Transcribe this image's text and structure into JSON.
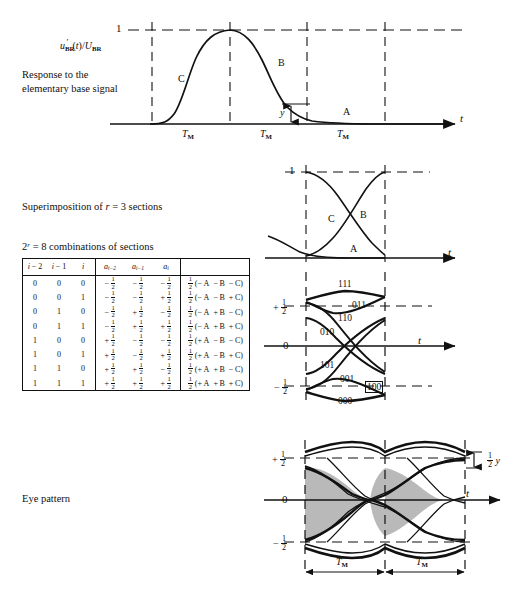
{
  "figure": {
    "panels": [
      {
        "id": "response",
        "caption_lines": [
          "Response to the",
          "elementary base signal"
        ],
        "y_axis_label": "u'BR (t)/UBR",
        "y_tick": "1",
        "x_axis_label": "t",
        "segment_label": "TM",
        "segment_count": 3,
        "curve_labels": [
          "C",
          "B",
          "A"
        ],
        "amplitude_marker": "y"
      },
      {
        "id": "superimposition",
        "caption": "Superimposition of r = 3 sections",
        "y_tick": "1",
        "x_axis_label": "t",
        "curve_labels": [
          "C",
          "B",
          "A"
        ]
      },
      {
        "id": "combinations",
        "caption": "2r = 8 combinations of sections",
        "x_axis_label": "t",
        "y_ticks": [
          "+ 1/2",
          "0",
          "- 1/2"
        ],
        "trace_labels": [
          "111",
          "011",
          "110",
          "010",
          "101",
          "001",
          "000",
          "100"
        ],
        "boxed_trace_label": "100"
      },
      {
        "id": "eye-pattern",
        "caption": "Eye pattern",
        "x_axis_label": "t",
        "y_ticks": [
          "+ 1/2",
          "0",
          "- 1/2"
        ],
        "opening_marker": "1/2 y",
        "segment_label": "TM",
        "segment_count": 2
      }
    ]
  },
  "table": {
    "headers_bits": [
      "i - 2",
      "i - 1",
      "i"
    ],
    "headers_a": [
      "ai-2",
      "ai-1",
      "ai"
    ],
    "headers_expr": "",
    "rows": [
      {
        "bits": [
          "0",
          "0",
          "0"
        ],
        "a": [
          "-",
          "-",
          "-"
        ],
        "expr": [
          "-",
          "-",
          "-"
        ]
      },
      {
        "bits": [
          "0",
          "0",
          "1"
        ],
        "a": [
          "-",
          "-",
          "+"
        ],
        "expr": [
          "-",
          "-",
          "+"
        ]
      },
      {
        "bits": [
          "0",
          "1",
          "0"
        ],
        "a": [
          "-",
          "+",
          "-"
        ],
        "expr": [
          "-",
          "+",
          "-"
        ]
      },
      {
        "bits": [
          "0",
          "1",
          "1"
        ],
        "a": [
          "-",
          "+",
          "+"
        ],
        "expr": [
          "-",
          "+",
          "+"
        ]
      },
      {
        "bits": [
          "1",
          "0",
          "0"
        ],
        "a": [
          "+",
          "-",
          "-"
        ],
        "expr": [
          "+",
          "-",
          "-"
        ]
      },
      {
        "bits": [
          "1",
          "0",
          "1"
        ],
        "a": [
          "+",
          "-",
          "+"
        ],
        "expr": [
          "+",
          "-",
          "+"
        ]
      },
      {
        "bits": [
          "1",
          "1",
          "0"
        ],
        "a": [
          "+",
          "+",
          "-"
        ],
        "expr": [
          "+",
          "+",
          "-"
        ]
      },
      {
        "bits": [
          "1",
          "1",
          "1"
        ],
        "a": [
          "+",
          "+",
          "+"
        ],
        "expr": [
          "+",
          "+",
          "+"
        ]
      }
    ],
    "expr_terms": [
      "A",
      "B",
      "C"
    ],
    "expr_coefficient": "1/2",
    "cell_magnitude": "1/2"
  },
  "colors": {
    "ink": "#111111",
    "eye_fill": "#b9b9b9",
    "paper": "#ffffff"
  }
}
